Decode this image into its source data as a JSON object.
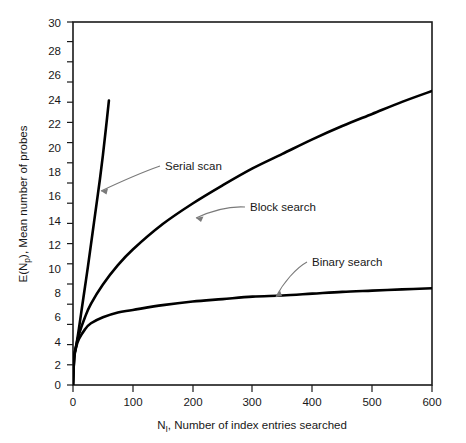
{
  "chart_data": {
    "type": "line",
    "title": "",
    "xlabel": "N , Number of index entries searched",
    "xlabel_sym": "N",
    "xlabel_sub": "I",
    "xlabel_rest": ", Number of index entries searched",
    "ylabel": "E(N ), Mean number of probes",
    "ylabel_sym": "E(N",
    "ylabel_sub": "p",
    "ylabel_rest": "), Mean number of probes",
    "xlim": [
      0,
      600
    ],
    "ylim": [
      0,
      30
    ],
    "xticks": [
      0,
      100,
      200,
      300,
      400,
      500,
      600
    ],
    "xtick_labels": [
      "0",
      "100",
      "200",
      "300",
      "400",
      "500",
      "600"
    ],
    "yticks": [
      0,
      2,
      4,
      6,
      8,
      10,
      12,
      14,
      16,
      18,
      20,
      22,
      24,
      26,
      28,
      30
    ],
    "ytick_labels": [
      "0",
      "2",
      "4",
      "6",
      "8",
      "10",
      "12",
      "14",
      "16",
      "18",
      "20",
      "22",
      "24",
      "26",
      "28",
      "30"
    ],
    "grid": false,
    "legend_position": "inline-annotations",
    "line_color": "#000000",
    "axis_color": "#1a1a1a",
    "background": "#ffffff",
    "series": [
      {
        "name": "Serial scan",
        "x": [
          0,
          2,
          5,
          10,
          15,
          20,
          25,
          30,
          35,
          40,
          45,
          50,
          55,
          60
        ],
        "values": [
          0,
          2.2,
          3.1,
          4.7,
          6.4,
          8.1,
          9.8,
          11.6,
          13.4,
          15.2,
          17.0,
          19.0,
          21.2,
          23.5
        ]
      },
      {
        "name": "Block search",
        "x": [
          0,
          2,
          5,
          10,
          20,
          30,
          50,
          75,
          100,
          150,
          200,
          250,
          300,
          350,
          400,
          450,
          500,
          550,
          600
        ],
        "values": [
          0,
          2.3,
          3.2,
          4.2,
          5.6,
          6.7,
          8.3,
          9.9,
          11.2,
          13.3,
          15.0,
          16.5,
          17.9,
          19.1,
          20.3,
          21.4,
          22.4,
          23.4,
          24.3
        ]
      },
      {
        "name": "Binary search",
        "x": [
          0,
          2,
          5,
          10,
          20,
          30,
          50,
          75,
          100,
          150,
          200,
          250,
          300,
          350,
          400,
          450,
          500,
          550,
          600
        ],
        "values": [
          0,
          2.3,
          3.1,
          3.8,
          4.6,
          5.1,
          5.6,
          6.0,
          6.2,
          6.6,
          6.9,
          7.1,
          7.3,
          7.4,
          7.55,
          7.7,
          7.8,
          7.9,
          8.0
        ]
      }
    ],
    "annotations": [
      {
        "label": "Serial scan",
        "text_x": 163,
        "text_y": 169,
        "target_x": 99,
        "target_y": 192
      },
      {
        "label": "Block search",
        "text_x": 248,
        "text_y": 209,
        "target_x": 194,
        "target_y": 219
      },
      {
        "label": "Binary search",
        "text_x": 310,
        "text_y": 264,
        "target_x": 274,
        "target_y": 299
      }
    ]
  }
}
